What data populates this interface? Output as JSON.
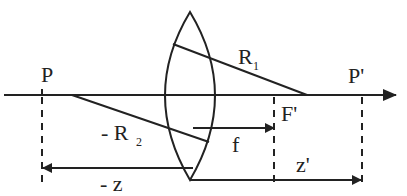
{
  "diagram": {
    "type": "thin-lens-geometry",
    "labels": {
      "object_point": "P",
      "image_point": "P'",
      "focal_point": "F'",
      "radius_1": "R",
      "radius_1_sub": "1",
      "radius_2_prefix": "- R",
      "radius_2_sub": "2",
      "focal_length": "f",
      "object_distance": "- z",
      "image_distance": "z'"
    },
    "colors": {
      "ink": "#222222",
      "background": "#ffffff"
    }
  }
}
